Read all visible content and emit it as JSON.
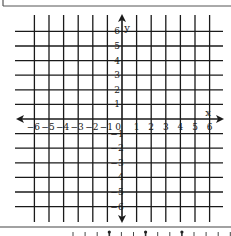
{
  "diagram": {
    "type": "coordinate-plane",
    "grid": {
      "x_min": -6,
      "x_max": 6,
      "y_min": -6,
      "y_max": 6,
      "origin_px": [
        122,
        119
      ],
      "unit_px": 14.6,
      "line_color": "#1a1a1a"
    },
    "axes": {
      "x_label": "x",
      "y_label": "y",
      "origin_label": "0",
      "x_ticks": [
        "-6",
        "-5",
        "-4",
        "-3",
        "-2",
        "-1",
        "1",
        "2",
        "3",
        "4",
        "5",
        "6"
      ],
      "y_ticks_positive": [
        "1",
        "2",
        "3",
        "4",
        "5",
        "6"
      ],
      "y_ticks_negative": [
        "-1",
        "-2",
        "-3",
        "-4",
        "-5",
        "-6"
      ]
    },
    "bottom_strip": {
      "description": "partially visible number line with tick marks",
      "tick_count": 14,
      "emphasized_ticks": 3
    }
  }
}
